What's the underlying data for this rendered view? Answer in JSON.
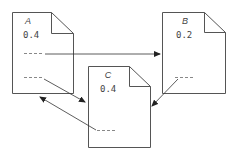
{
  "diagram": {
    "type": "pagerank-documents",
    "documents": [
      {
        "id": "A",
        "label": "A",
        "value": "0.4"
      },
      {
        "id": "B",
        "label": "B",
        "value": "0.2"
      },
      {
        "id": "C",
        "label": "C",
        "value": "0.4"
      }
    ],
    "link_marker": "---",
    "edges": [
      {
        "from": "A",
        "to": "B"
      },
      {
        "from": "A",
        "to": "C"
      },
      {
        "from": "B",
        "to": "C"
      },
      {
        "from": "C",
        "to": "A"
      }
    ],
    "colors": {
      "stroke": "#555555",
      "text": "#444444",
      "dash": "#888888"
    }
  }
}
